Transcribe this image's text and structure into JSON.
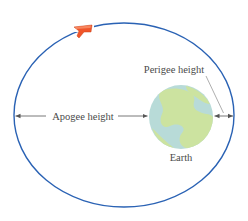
{
  "diagram": {
    "labels": {
      "apogee": "Apogee height",
      "perigee": "Perigee height",
      "earth": "Earth"
    },
    "colors": {
      "orbit": "#2a62b4",
      "earth_land": "#c9e2a0",
      "earth_water": "#b5d8dc",
      "satellite": "#f0552a",
      "arrows": "#555555",
      "text": "#4a4a4a"
    },
    "elements": {
      "orbit": "ellipse",
      "satellite-icon": "red-orange satellite on orbit (top)",
      "earth-icon": "globe at right focus"
    }
  }
}
